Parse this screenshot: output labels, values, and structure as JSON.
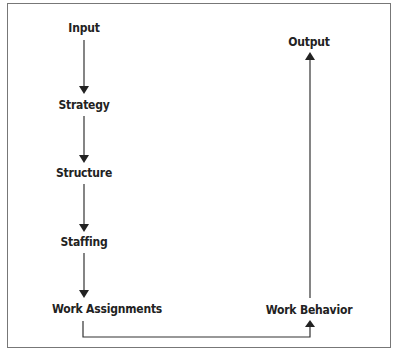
{
  "diagram": {
    "nodes": [
      {
        "id": "input",
        "label": "Input"
      },
      {
        "id": "strategy",
        "label": "Strategy"
      },
      {
        "id": "structure",
        "label": "Structure"
      },
      {
        "id": "staffing",
        "label": "Staffing"
      },
      {
        "id": "work_assignments",
        "label": "Work Assignments"
      },
      {
        "id": "work_behavior",
        "label": "Work Behavior"
      },
      {
        "id": "output",
        "label": "Output"
      }
    ],
    "edges": [
      {
        "from": "input",
        "to": "strategy"
      },
      {
        "from": "strategy",
        "to": "structure"
      },
      {
        "from": "structure",
        "to": "staffing"
      },
      {
        "from": "staffing",
        "to": "work_assignments"
      },
      {
        "from": "work_assignments",
        "to": "work_behavior"
      },
      {
        "from": "work_behavior",
        "to": "output"
      }
    ],
    "colors": {
      "line": "#333333",
      "frame": "#777777",
      "text": "#222222"
    }
  }
}
